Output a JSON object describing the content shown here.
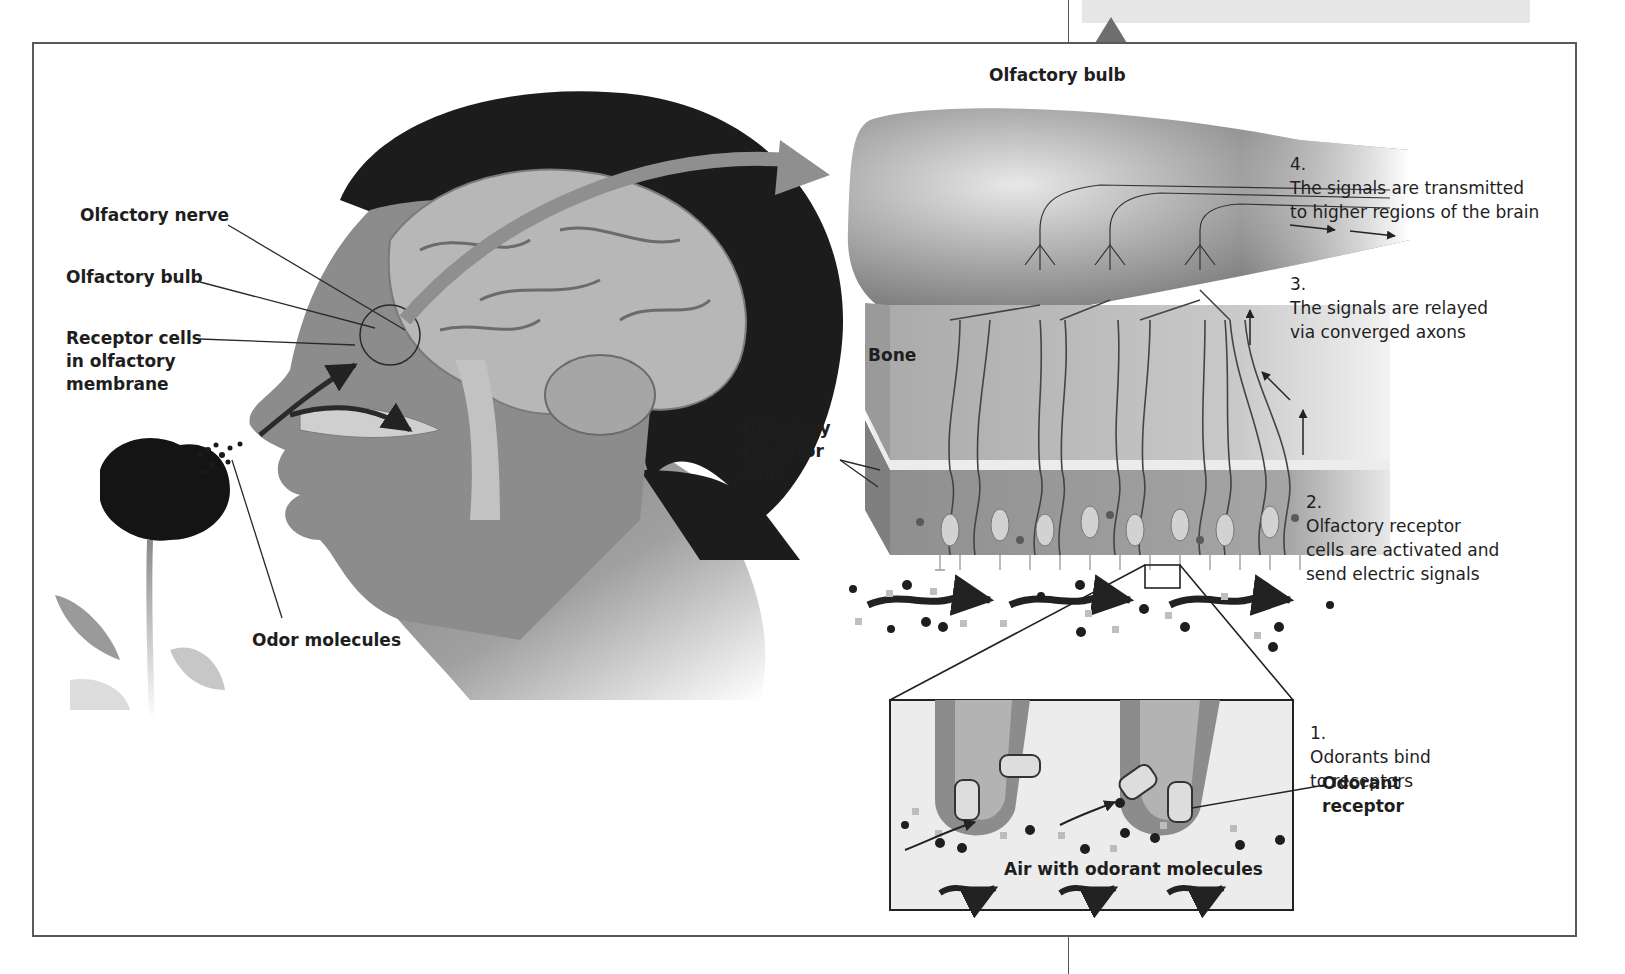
{
  "figure": {
    "domain_note": "Olfaction diagram: anatomy of smell from odor molecules to brain",
    "left_panel": {
      "labels": {
        "olfactory_nerve": "Olfactory nerve",
        "olfactory_bulb": "Olfactory bulb",
        "receptor_cells": "Receptor cells\nin olfactory\nmembrane",
        "odor_molecules": "Odor molecules"
      }
    },
    "right_panel": {
      "labels": {
        "olfactory_bulb": "Olfactory bulb",
        "bone": "Bone",
        "olfactory_receptor_cells": "Olfactory\nreceptor\ncells",
        "odorant_receptor": "Odorant\nreceptor",
        "air_with_odorant_molecules": "Air with odorant molecules"
      },
      "steps": [
        {
          "number": "1.",
          "text": "Odorants bind\nto receptors"
        },
        {
          "number": "2.",
          "text": "Olfactory receptor\ncells are activated and\nsend electric signals"
        },
        {
          "number": "3.",
          "text": "The signals are relayed\nvia converged axons"
        },
        {
          "number": "4.",
          "text": "The signals are transmitted\nto higher regions of the brain"
        }
      ]
    },
    "colors": {
      "frame": "#5a5a5a",
      "hair": "#1c1c1c",
      "skin": "#8a8a8a",
      "bulb": "#7d7d7d",
      "bone": "#bdbdbd",
      "caption_box": "#e6e6e6"
    }
  }
}
